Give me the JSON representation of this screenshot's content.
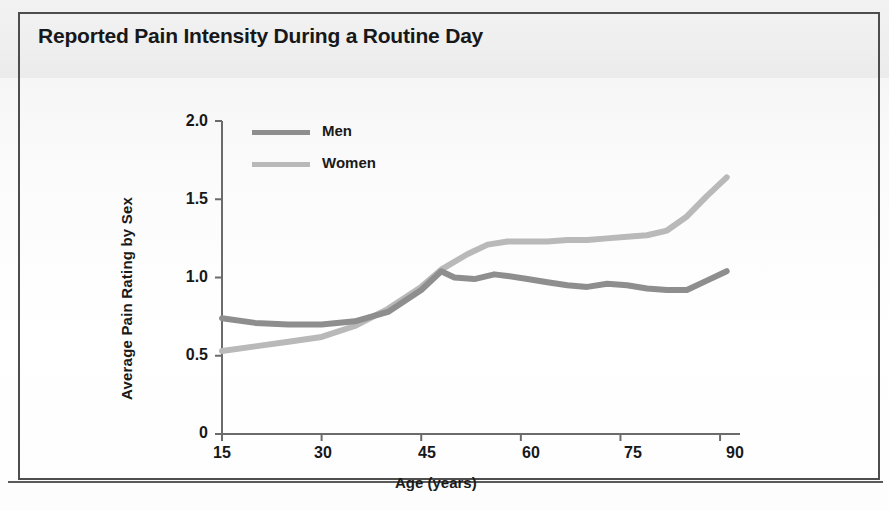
{
  "figure": {
    "title": "Reported Pain Intensity During a Routine Day"
  },
  "colors": {
    "men_line": "#8e8e8e",
    "women_line": "#b9b9b9",
    "axis": "#6b6b6b",
    "text": "#17181a",
    "frame": "#4d4d4d"
  },
  "chart_data": {
    "type": "line",
    "title": "Reported Pain Intensity During a Routine Day",
    "xlabel": "Age (years)",
    "ylabel": "Average Pain Rating by Sex",
    "xlim": [
      15,
      93
    ],
    "ylim": [
      0,
      2.0
    ],
    "xticks": [
      15,
      30,
      45,
      60,
      75,
      90
    ],
    "xtick_labels": [
      "15",
      "30",
      "45",
      "60",
      "75",
      "90"
    ],
    "yticks": [
      0,
      0.5,
      1.0,
      1.5,
      2.0
    ],
    "ytick_labels": [
      "0",
      "0.5",
      "1.0",
      "1.5",
      "2.0"
    ],
    "grid": false,
    "legend_position": "upper left",
    "series": [
      {
        "name": "Men",
        "color": "#8e8e8e",
        "x": [
          15,
          20,
          25,
          30,
          35,
          40,
          45,
          48,
          50,
          53,
          56,
          58,
          61,
          64,
          67,
          70,
          73,
          76,
          79,
          82,
          85,
          88,
          91
        ],
        "y": [
          0.74,
          0.71,
          0.7,
          0.7,
          0.72,
          0.78,
          0.92,
          1.04,
          1.0,
          0.99,
          1.02,
          1.01,
          0.99,
          0.97,
          0.95,
          0.94,
          0.96,
          0.95,
          0.93,
          0.92,
          0.92,
          0.98,
          1.04
        ]
      },
      {
        "name": "Women",
        "color": "#b9b9b9",
        "x": [
          15,
          20,
          25,
          30,
          35,
          40,
          45,
          48,
          52,
          55,
          58,
          61,
          64,
          67,
          70,
          73,
          76,
          79,
          82,
          85,
          88,
          91
        ],
        "y": [
          0.53,
          0.56,
          0.59,
          0.62,
          0.69,
          0.8,
          0.94,
          1.05,
          1.15,
          1.21,
          1.23,
          1.23,
          1.23,
          1.24,
          1.24,
          1.25,
          1.26,
          1.27,
          1.3,
          1.39,
          1.52,
          1.64
        ]
      }
    ]
  },
  "legend": {
    "entries": [
      {
        "label": "Men"
      },
      {
        "label": "Women"
      }
    ]
  }
}
